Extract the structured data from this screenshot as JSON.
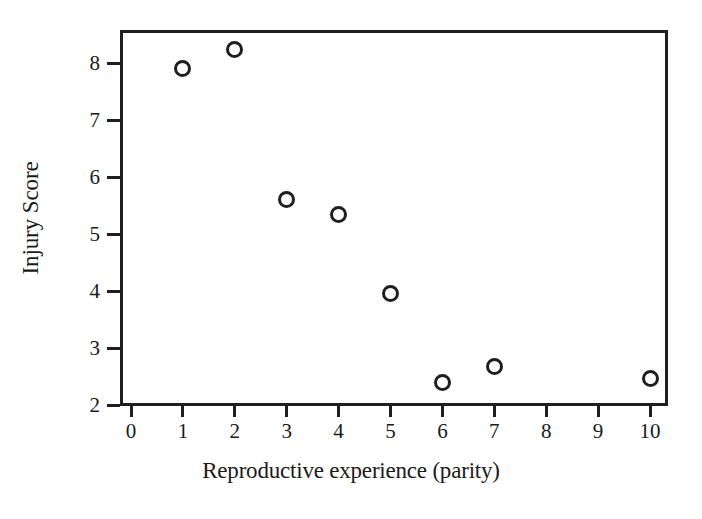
{
  "chart_data": {
    "type": "scatter",
    "title": "",
    "xlabel": "Reproductive experience (parity)",
    "ylabel": "Injury Score",
    "xlim": [
      0,
      10.35
    ],
    "ylim": [
      2,
      8.6
    ],
    "grid": false,
    "legend": null,
    "marker": "open-circle",
    "x_ticks": [
      0,
      1,
      2,
      3,
      4,
      5,
      6,
      7,
      8,
      9,
      10
    ],
    "x_tick_labels": [
      "0",
      "1",
      "2",
      "3",
      "4",
      "5",
      "6",
      "7",
      "8",
      "9",
      "10"
    ],
    "y_ticks": [
      2,
      3,
      4,
      5,
      6,
      7,
      8
    ],
    "y_tick_labels": [
      "2",
      "3",
      "4",
      "5",
      "6",
      "7",
      "8"
    ],
    "x": [
      1,
      2,
      3,
      4,
      5,
      6,
      7,
      10
    ],
    "values": [
      7.91,
      8.23,
      5.61,
      5.34,
      3.96,
      2.4,
      2.67,
      2.46
    ],
    "points": [
      {
        "x": 1,
        "y": 7.91
      },
      {
        "x": 2,
        "y": 8.23
      },
      {
        "x": 3,
        "y": 5.61
      },
      {
        "x": 4,
        "y": 5.34
      },
      {
        "x": 5,
        "y": 3.96
      },
      {
        "x": 6,
        "y": 2.4
      },
      {
        "x": 7,
        "y": 2.67
      },
      {
        "x": 10,
        "y": 2.46
      }
    ],
    "colors": {
      "marker": "#1f1f1f",
      "axis": "#1f1f1f",
      "background": "#ffffff"
    }
  }
}
